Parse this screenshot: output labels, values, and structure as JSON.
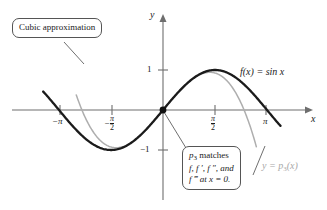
{
  "figure": {
    "axes": {
      "y_axis_label": "y",
      "x_axis_label": "x"
    },
    "y_ticks": [
      {
        "value": 1,
        "label": "1"
      },
      {
        "value": -1,
        "label": "−1"
      }
    ],
    "x_ticks": [
      {
        "value": -3.14159,
        "label": "−π",
        "numerator": "",
        "denominator": ""
      },
      {
        "value": -1.5708,
        "label": "",
        "numerator": "π",
        "denominator": "2",
        "sign": "−"
      },
      {
        "value": 1.5708,
        "label": "",
        "numerator": "π",
        "denominator": "2",
        "sign": ""
      },
      {
        "value": 3.14159,
        "label": "π",
        "numerator": "",
        "denominator": ""
      }
    ],
    "callouts": [
      {
        "id": "cubic-approximation",
        "text": "Cubic approximation"
      },
      {
        "id": "p3-matches",
        "line1_a": "p",
        "line1_sub": "3",
        "line1_b": " matches",
        "line2": "f, f ′, f ″, and",
        "line3_a": "f ‴",
        "line3_b": " at x = 0."
      }
    ],
    "curve_labels": [
      {
        "id": "sin-label",
        "text_a": "f",
        "text_b": "(x) = sin x",
        "color": "#1b1b1b"
      },
      {
        "id": "p3-label",
        "text_a": "y = p",
        "text_sub": "3",
        "text_b": "(x)",
        "color": "#a8a8a8"
      }
    ],
    "colors": {
      "sin_curve": "#1b1b1b",
      "cubic_curve": "#aeaeae",
      "axis": "#6e6e6e",
      "callout_border": "#555555",
      "background": "#ffffff"
    }
  },
  "chart_data": {
    "type": "line",
    "title": "Cubic approximation",
    "xlabel": "x",
    "ylabel": "y",
    "xlim": [
      -3.6,
      3.9
    ],
    "ylim": [
      -2.1,
      1.9
    ],
    "grid": false,
    "legend": "inline-labels",
    "xticks": [
      -3.14159,
      -1.5708,
      1.5708,
      3.14159
    ],
    "xticklabels": [
      "−π",
      "−π/2",
      "π/2",
      "π"
    ],
    "yticks": [
      1,
      -1
    ],
    "yticklabels": [
      "1",
      "−1"
    ],
    "series": [
      {
        "name": "f(x) = sin x",
        "color": "#1b1b1b",
        "formula": "sin(x)",
        "x": [
          -3.45,
          -3.0,
          -2.5,
          -2.0,
          -1.5708,
          -1.0,
          -0.5,
          0.0,
          0.5,
          1.0,
          1.5708,
          2.0,
          2.5,
          3.0,
          3.45
        ],
        "y": [
          0.3045,
          -0.1411,
          -0.5985,
          -0.9093,
          -1.0,
          -0.8415,
          -0.4794,
          0.0,
          0.4794,
          0.8415,
          1.0,
          0.9093,
          0.5985,
          0.1411,
          -0.3045
        ]
      },
      {
        "name": "y = p3(x)",
        "color": "#aeaeae",
        "formula": "x - x^3/6",
        "x": [
          -2.55,
          -2.3,
          -2.0,
          -1.5708,
          -1.0,
          -0.5,
          0.0,
          0.5,
          1.0,
          1.5708,
          2.0,
          2.3,
          2.55,
          2.8
        ],
        "y": [
          0.1134,
          -0.2706,
          -0.6667,
          -0.9248,
          -0.8333,
          -0.4792,
          0.0,
          0.4792,
          0.8333,
          0.9248,
          0.6667,
          0.2706,
          -0.1134,
          -0.8587
        ]
      }
    ],
    "annotations": [
      {
        "text": "Cubic approximation",
        "points_to": "cubic curve left branch"
      },
      {
        "text": "p3 matches f, f', f'', and f''' at x = 0.",
        "points_to": "origin"
      },
      {
        "text": "f(x) = sin x",
        "points_to": "sine curve right"
      },
      {
        "text": "y = p3(x)",
        "points_to": "cubic curve right branch"
      }
    ]
  }
}
